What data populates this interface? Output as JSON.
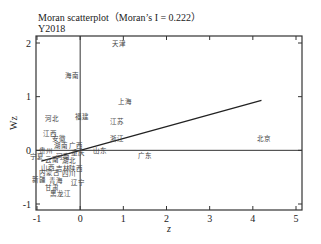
{
  "header": {
    "title": "Moran scatterplot（Moran’s I = 0.222）",
    "subtitle": "Y2018"
  },
  "chart_data": {
    "type": "scatter",
    "subtitle": "Y2018",
    "xlabel": "z",
    "ylabel": "Wz",
    "xlim": [
      -1,
      5
    ],
    "ylim": [
      -1,
      2
    ],
    "xticks": [
      -1,
      0,
      1,
      2,
      3,
      4,
      5
    ],
    "yticks": [
      -1,
      0,
      1,
      2
    ],
    "moran_i": 0.222,
    "regression_line": {
      "x": [
        -0.9,
        4.2
      ],
      "y": [
        -0.2,
        0.93
      ]
    },
    "points": [
      {
        "label": "天津",
        "x": 0.9,
        "y": 1.98
      },
      {
        "label": "海南",
        "x": -0.2,
        "y": 1.38
      },
      {
        "label": "上海",
        "x": 1.05,
        "y": 0.9
      },
      {
        "label": "河北",
        "x": -0.65,
        "y": 0.58
      },
      {
        "label": "福建",
        "x": 0.05,
        "y": 0.63
      },
      {
        "label": "江苏",
        "x": 0.85,
        "y": 0.52
      },
      {
        "label": "江西",
        "x": -0.7,
        "y": 0.3
      },
      {
        "label": "安徽",
        "x": -0.5,
        "y": 0.22
      },
      {
        "label": "浙江",
        "x": 0.85,
        "y": 0.22
      },
      {
        "label": "北京",
        "x": 4.25,
        "y": 0.22
      },
      {
        "label": "湖南",
        "x": -0.45,
        "y": 0.08
      },
      {
        "label": "广西",
        "x": -0.1,
        "y": 0.08
      },
      {
        "label": "贵州",
        "x": -0.8,
        "y": -0.02
      },
      {
        "label": "重庆",
        "x": -0.05,
        "y": -0.05
      },
      {
        "label": "山东",
        "x": 0.45,
        "y": -0.02
      },
      {
        "label": "广东",
        "x": 1.5,
        "y": -0.1
      },
      {
        "label": "宁夏",
        "x": -1.0,
        "y": -0.12
      },
      {
        "label": "云南",
        "x": -0.65,
        "y": -0.18
      },
      {
        "label": "河南",
        "x": -0.4,
        "y": -0.12
      },
      {
        "label": "湖北",
        "x": -0.25,
        "y": -0.2
      },
      {
        "label": "山西",
        "x": -0.75,
        "y": -0.32
      },
      {
        "label": "吉林",
        "x": -0.4,
        "y": -0.35
      },
      {
        "label": "陕西",
        "x": -0.1,
        "y": -0.35
      },
      {
        "label": "内蒙古",
        "x": -0.7,
        "y": -0.42
      },
      {
        "label": "四川",
        "x": -0.25,
        "y": -0.45
      },
      {
        "label": "新疆",
        "x": -0.95,
        "y": -0.55
      },
      {
        "label": "青海",
        "x": -0.55,
        "y": -0.58
      },
      {
        "label": "辽宁",
        "x": -0.05,
        "y": -0.6
      },
      {
        "label": "甘肃",
        "x": -0.65,
        "y": -0.7
      },
      {
        "label": "黑龙江",
        "x": -0.45,
        "y": -0.82
      }
    ],
    "grid": false,
    "legend": "none"
  },
  "plot": {
    "colors": {
      "axis": "#222222",
      "text": "#222222",
      "label": "#444444",
      "line": "#222222"
    }
  }
}
